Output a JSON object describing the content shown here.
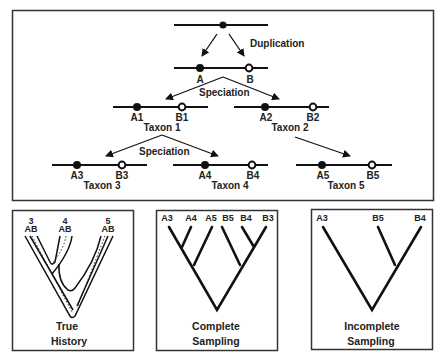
{
  "top_panel": {
    "events": {
      "duplication": "Duplication",
      "speciation_1": "Speciation",
      "speciation_2": "Speciation"
    },
    "ancestral_gene": "",
    "genes": {
      "A": "A",
      "B": "B",
      "A1": "A1",
      "B1": "B1",
      "A2": "A2",
      "B2": "B2",
      "A3": "A3",
      "B3": "B3",
      "A4": "A4",
      "B4": "B4",
      "A5": "A5",
      "B5": "B5"
    },
    "taxa": {
      "taxon1": "Taxon 1",
      "taxon2": "Taxon 2",
      "taxon3": "Taxon 3",
      "taxon4": "Taxon 4",
      "taxon5": "Taxon 5"
    }
  },
  "true_history": {
    "title_line1": "True",
    "title_line2": "History",
    "taxa": [
      {
        "number": "3",
        "genes": "AB"
      },
      {
        "number": "4",
        "genes": "AB"
      },
      {
        "number": "5",
        "genes": "AB"
      }
    ]
  },
  "complete_sampling": {
    "title_line1": "Complete",
    "title_line2": "Sampling",
    "leaves": [
      "A3",
      "A4",
      "A5",
      "B5",
      "B4",
      "B3"
    ]
  },
  "incomplete_sampling": {
    "title_line1": "Incomplete",
    "title_line2": "Sampling",
    "leaves": [
      "A3",
      "B5",
      "B4"
    ]
  },
  "colors": {
    "line": "#111111",
    "border": "#222222",
    "background": "#ffffff",
    "open_marker_fill": "#ffffff"
  }
}
